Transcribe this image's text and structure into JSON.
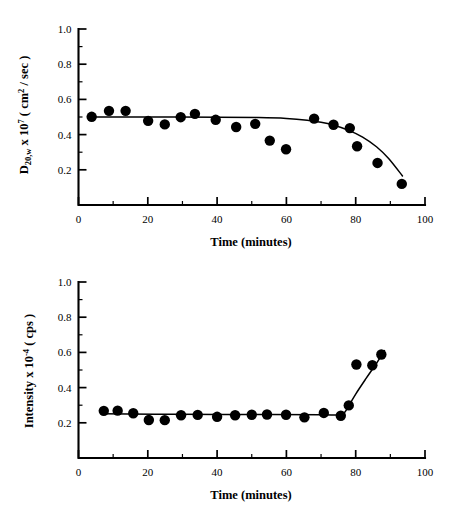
{
  "figure": {
    "background_color": "#ffffff",
    "ink_color": "#000000"
  },
  "chart_data": [
    {
      "id": "diffusion-coefficient-panel",
      "type": "scatter",
      "title": "",
      "xlabel": "Time (minutes)",
      "ylabel": "D20,w x 107 ( cm2 / sec )",
      "ylabel_parts": {
        "base": "D",
        "subscript": "20,w",
        "mid": " x 10",
        "superscript": "7",
        "tail": " ( cm",
        "superscript2": "2",
        "tail2": " / sec )"
      },
      "xlim": [
        0,
        100
      ],
      "ylim": [
        0,
        1.0
      ],
      "xticks": [
        0,
        20,
        40,
        60,
        80,
        100
      ],
      "xtick_labels": [
        "0",
        "20",
        "40",
        "60",
        "80",
        "100"
      ],
      "yticks": [
        0.2,
        0.4,
        0.6,
        0.8,
        1.0
      ],
      "ytick_labels": [
        "0.2",
        "0.4",
        "0.6",
        "0.8",
        "1.0"
      ],
      "x_minor_step": 10,
      "y_minor_step": 0.1,
      "grid": false,
      "legend": false,
      "marker": "filled-circle",
      "marker_size_px": 5.2,
      "points": [
        {
          "x": 3.8,
          "y": 0.501
        },
        {
          "x": 8.8,
          "y": 0.535
        },
        {
          "x": 13.6,
          "y": 0.535
        },
        {
          "x": 20.1,
          "y": 0.478
        },
        {
          "x": 24.9,
          "y": 0.458
        },
        {
          "x": 29.5,
          "y": 0.499
        },
        {
          "x": 33.6,
          "y": 0.518
        },
        {
          "x": 39.6,
          "y": 0.484
        },
        {
          "x": 45.5,
          "y": 0.443
        },
        {
          "x": 51.0,
          "y": 0.461
        },
        {
          "x": 55.2,
          "y": 0.366
        },
        {
          "x": 59.9,
          "y": 0.317
        },
        {
          "x": 68.0,
          "y": 0.491
        },
        {
          "x": 73.6,
          "y": 0.456
        },
        {
          "x": 78.3,
          "y": 0.437
        },
        {
          "x": 80.4,
          "y": 0.334
        },
        {
          "x": 86.3,
          "y": 0.239
        },
        {
          "x": 93.3,
          "y": 0.12
        }
      ],
      "fit_curve": [
        {
          "x": 3.2,
          "y": 0.5
        },
        {
          "x": 20.0,
          "y": 0.5
        },
        {
          "x": 40.0,
          "y": 0.499
        },
        {
          "x": 52.0,
          "y": 0.497
        },
        {
          "x": 60.0,
          "y": 0.492
        },
        {
          "x": 66.0,
          "y": 0.482
        },
        {
          "x": 70.0,
          "y": 0.47
        },
        {
          "x": 74.0,
          "y": 0.452
        },
        {
          "x": 78.0,
          "y": 0.424
        },
        {
          "x": 82.0,
          "y": 0.386
        },
        {
          "x": 86.0,
          "y": 0.331
        },
        {
          "x": 89.5,
          "y": 0.264
        },
        {
          "x": 93.5,
          "y": 0.165
        }
      ]
    },
    {
      "id": "scattered-intensity-panel",
      "type": "scatter",
      "title": "",
      "xlabel": "Time (minutes)",
      "ylabel": "Intensity x 10-4 ( cps )",
      "ylabel_parts": {
        "base": "Intensity x 10",
        "superscript": "-4",
        "tail": " ( cps )"
      },
      "xlim": [
        0,
        100
      ],
      "ylim": [
        0,
        1.0
      ],
      "xticks": [
        0,
        20,
        40,
        60,
        80,
        100
      ],
      "xtick_labels": [
        "0",
        "20",
        "40",
        "60",
        "80",
        "100"
      ],
      "yticks": [
        0.2,
        0.4,
        0.6,
        0.8,
        1.0
      ],
      "ytick_labels": [
        "0.2",
        "0.4",
        "0.6",
        "0.8",
        "1.0"
      ],
      "x_minor_step": 10,
      "y_minor_step": 0.1,
      "grid": false,
      "legend": false,
      "marker": "filled-circle",
      "marker_size_px": 5.2,
      "points": [
        {
          "x": 7.3,
          "y": 0.268
        },
        {
          "x": 11.3,
          "y": 0.269
        },
        {
          "x": 15.8,
          "y": 0.254
        },
        {
          "x": 20.3,
          "y": 0.216
        },
        {
          "x": 24.9,
          "y": 0.215
        },
        {
          "x": 29.6,
          "y": 0.243
        },
        {
          "x": 34.4,
          "y": 0.245
        },
        {
          "x": 40.0,
          "y": 0.234
        },
        {
          "x": 45.2,
          "y": 0.243
        },
        {
          "x": 50.0,
          "y": 0.246
        },
        {
          "x": 54.4,
          "y": 0.247
        },
        {
          "x": 59.9,
          "y": 0.246
        },
        {
          "x": 65.2,
          "y": 0.231
        },
        {
          "x": 70.8,
          "y": 0.256
        },
        {
          "x": 75.7,
          "y": 0.24
        },
        {
          "x": 78.0,
          "y": 0.299
        },
        {
          "x": 80.2,
          "y": 0.531
        },
        {
          "x": 84.8,
          "y": 0.527
        },
        {
          "x": 87.4,
          "y": 0.588
        }
      ],
      "fit_curve": [
        {
          "x": 6.8,
          "y": 0.252
        },
        {
          "x": 30.0,
          "y": 0.248
        },
        {
          "x": 55.0,
          "y": 0.247
        },
        {
          "x": 70.0,
          "y": 0.246
        },
        {
          "x": 74.5,
          "y": 0.245
        },
        {
          "x": 76.5,
          "y": 0.252
        },
        {
          "x": 78.0,
          "y": 0.296
        },
        {
          "x": 80.0,
          "y": 0.363
        },
        {
          "x": 83.0,
          "y": 0.452
        },
        {
          "x": 86.0,
          "y": 0.538
        },
        {
          "x": 88.3,
          "y": 0.61
        }
      ]
    }
  ]
}
